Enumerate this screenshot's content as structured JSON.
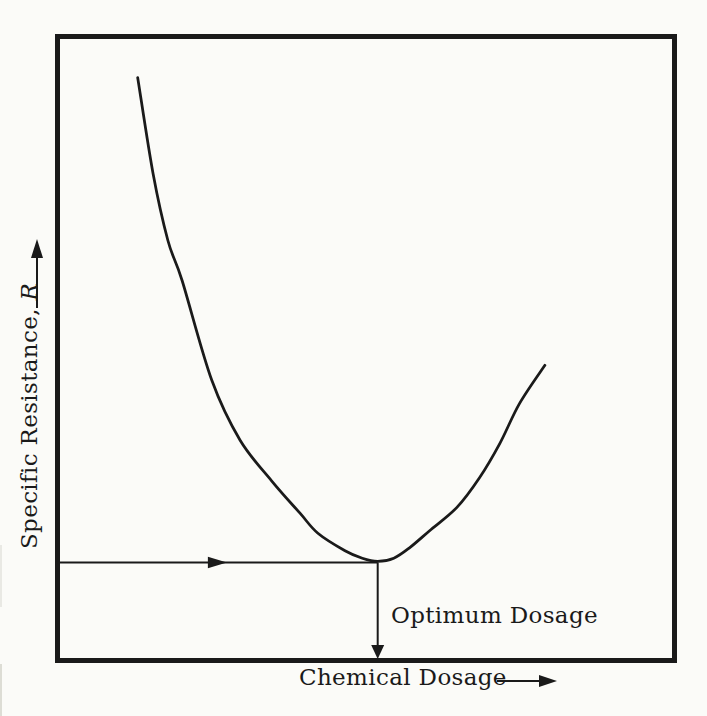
{
  "page": {
    "background_color": "#fbfbf8",
    "ink_color": "#1a1a1a"
  },
  "chart_data": {
    "type": "line",
    "title": "",
    "xlabel": "Chemical Dosage",
    "ylabel": "Specific Resistance, R",
    "ylabel_prefix": "Specific Resistance, ",
    "ylabel_var": "R",
    "axes_note": "qualitative axes, no tick marks or numeric labels; both axis labels end in a direction arrow",
    "x_range_norm": [
      0,
      1
    ],
    "R_range_norm": [
      0,
      1
    ],
    "series": [
      {
        "name": "specific-resistance-vs-chemical-dosage",
        "points": [
          [
            0.13,
            0.934
          ],
          [
            0.155,
            0.78
          ],
          [
            0.179,
            0.673
          ],
          [
            0.202,
            0.609
          ],
          [
            0.25,
            0.449
          ],
          [
            0.296,
            0.353
          ],
          [
            0.347,
            0.288
          ],
          [
            0.393,
            0.236
          ],
          [
            0.422,
            0.204
          ],
          [
            0.466,
            0.176
          ],
          [
            0.494,
            0.164
          ],
          [
            0.519,
            0.159
          ],
          [
            0.545,
            0.164
          ],
          [
            0.571,
            0.181
          ],
          [
            0.603,
            0.208
          ],
          [
            0.647,
            0.245
          ],
          [
            0.684,
            0.293
          ],
          [
            0.717,
            0.348
          ],
          [
            0.749,
            0.412
          ],
          [
            0.79,
            0.473
          ]
        ]
      }
    ],
    "optimum": {
      "x": 0.519,
      "R_min": 0.159
    },
    "guides": {
      "horizontal": {
        "R": 0.157,
        "x_from": 0.0,
        "x_to": 0.519,
        "arrowhead_x": 0.26,
        "direction": "right"
      },
      "vertical": {
        "x": 0.519,
        "R_from": 0.157,
        "R_to": 0.0,
        "direction": "down"
      }
    },
    "annotation": {
      "text": "Optimum Dosage",
      "x": 0.54,
      "R": 0.07
    },
    "legend": "none",
    "grid": "off"
  }
}
